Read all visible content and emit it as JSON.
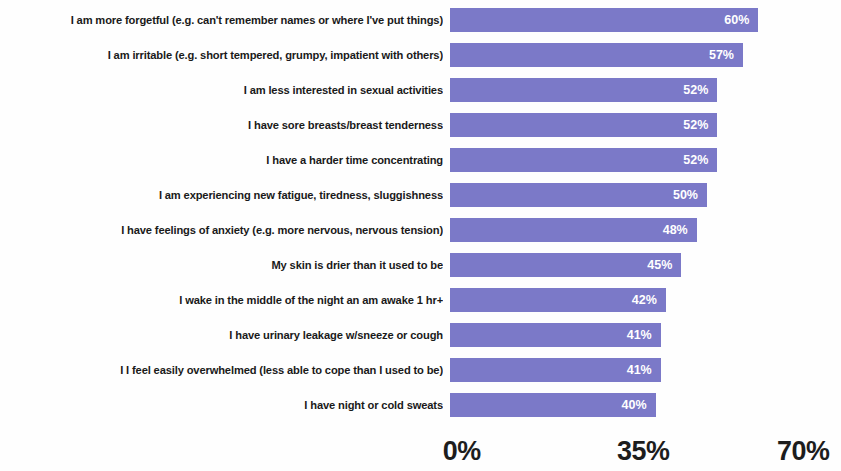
{
  "chart_data": {
    "type": "bar",
    "orientation": "horizontal",
    "title": "",
    "subtitle": "",
    "xlabel": "",
    "ylabel": "",
    "xlim": [
      0,
      70
    ],
    "grid": false,
    "legend": null,
    "bar_color": "#7b79c8",
    "value_label_color": "#ffffff",
    "value_label_suffix": "%",
    "axis_tick_labels": [
      "0%",
      "35%",
      "70%"
    ],
    "axis_tick_values": [
      0,
      35,
      70
    ],
    "categories": [
      "I am more forgetful (e.g. can't remember names or where I've put things)",
      "I am irritable (e.g. short tempered, grumpy, impatient with others)",
      "I am less interested in sexual activities",
      "I have sore breasts/breast tenderness",
      "I have a harder time concentrating",
      "I am experiencing new fatigue, tiredness, sluggishness",
      "I have feelings of anxiety (e.g. more nervous, nervous tension)",
      "My skin is drier than it used to be",
      "I wake in the middle of the night an am awake 1 hr+",
      "I have urinary leakage w/sneeze or cough",
      "I I feel easily overwhelmed (less able to cope than I used to be)",
      "I have night or cold sweats"
    ],
    "values": [
      60,
      57,
      52,
      52,
      52,
      50,
      48,
      45,
      42,
      41,
      41,
      40
    ],
    "value_labels": [
      "60%",
      "57%",
      "52%",
      "52%",
      "52%",
      "50%",
      "48%",
      "45%",
      "42%",
      "41%",
      "41%",
      "40%"
    ]
  }
}
